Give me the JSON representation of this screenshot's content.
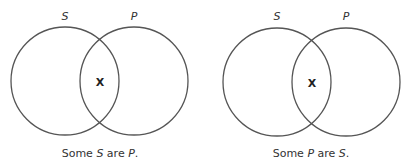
{
  "diagrams": [
    {
      "name": "some-s-are-p",
      "circles": [
        {
          "label": "S",
          "cx": 65,
          "cy": 81,
          "r": 54
        },
        {
          "label": "P",
          "cx": 134,
          "cy": 81,
          "r": 54
        }
      ],
      "mark": "X",
      "mark_pos": [
        100,
        85
      ],
      "caption": {
        "parts": [
          "Some ",
          "S",
          " are ",
          "P",
          "."
        ]
      }
    },
    {
      "name": "some-p-are-s",
      "circles": [
        {
          "label": "S",
          "cx": 277,
          "cy": 82,
          "r": 54
        },
        {
          "label": "P",
          "cx": 346,
          "cy": 82,
          "r": 54
        }
      ],
      "mark": "X",
      "mark_pos": [
        312,
        86
      ],
      "caption": {
        "parts": [
          "Some ",
          "P",
          " are ",
          "S",
          "."
        ]
      }
    }
  ],
  "colors": {
    "stroke": "#555555",
    "text": "#333333"
  }
}
